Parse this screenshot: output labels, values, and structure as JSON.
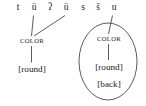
{
  "figure": {
    "type": "autosegmental-phonology-diagram",
    "caption_text": "",
    "segmental_tier": {
      "label": "segmental tier",
      "segments": [
        {
          "symbol": "t",
          "x": 17,
          "linked": false
        },
        {
          "symbol": "ü",
          "x": 33,
          "linked": true
        },
        {
          "symbol": "ʔ",
          "x": 49,
          "linked": false
        },
        {
          "symbol": "ü",
          "x": 65,
          "linked": true
        },
        {
          "symbol": "s",
          "x": 82,
          "linked": false
        },
        {
          "symbol": "š",
          "x": 97,
          "linked": false
        },
        {
          "symbol": "u",
          "x": 113,
          "linked": true
        }
      ]
    },
    "groups": [
      {
        "id": "left-group",
        "circled": false,
        "tier_node": {
          "label": "COLOR",
          "x": 31,
          "y": 40
        },
        "features": [
          {
            "label": "[round]",
            "x": 31,
            "y": 70
          }
        ],
        "association_lines": [
          {
            "from": "ü (position 2)",
            "to": "COLOR",
            "x1": 33,
            "y1": 15,
            "x2": 31,
            "y2": 36
          },
          {
            "from": "ü (position 4)",
            "to": "COLOR",
            "x1": 65,
            "y1": 15,
            "x2": 33,
            "y2": 36
          }
        ],
        "link_node_to_feature": {
          "x1": 31,
          "y1": 45,
          "x2": 31,
          "y2": 63
        }
      },
      {
        "id": "right-group",
        "circled": true,
        "circle": {
          "cx": 108,
          "cy": 61,
          "rx": 29,
          "ry": 38
        },
        "tier_node": {
          "label": "COLOR",
          "x": 108,
          "y": 38
        },
        "features": [
          {
            "label": "[round]",
            "x": 108,
            "y": 68
          },
          {
            "label": "[back]",
            "x": 108,
            "y": 85
          }
        ],
        "association_lines": [
          {
            "from": "u (position 7)",
            "to": "COLOR",
            "x1": 113,
            "y1": 15,
            "x2": 108,
            "y2": 34
          }
        ],
        "link_node_to_feature": {
          "x1": 108,
          "y1": 43,
          "x2": 108,
          "y2": 61
        }
      }
    ],
    "colors": {
      "ink": "#1a1a1a",
      "line": "#4a4a4a",
      "background": "#ffffff",
      "clipped_text_above": "#c9c9c9"
    },
    "clipped_header_fragment": "…………………"
  }
}
